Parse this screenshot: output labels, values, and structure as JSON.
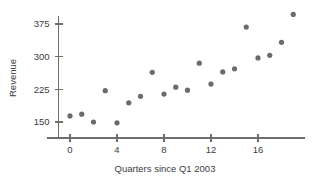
{
  "chart_data": {
    "type": "scatter",
    "title": "",
    "xlabel": "Quarters since Q1 2003",
    "ylabel": "Revenue",
    "xlim": [
      -1.2,
      20.5
    ],
    "ylim": [
      120,
      410
    ],
    "grid": false,
    "legend": null,
    "xticks": [
      0,
      4,
      8,
      12,
      16
    ],
    "yticks": [
      150,
      225,
      300,
      375
    ],
    "xtick_labels": [
      "0",
      "4",
      "8",
      "12",
      "16"
    ],
    "ytick_labels": [
      "150",
      "225",
      "300",
      "375"
    ],
    "point_color": "#6b6b6b",
    "axis_color": "#6e6e6e",
    "x": [
      0,
      1,
      2,
      3,
      4,
      5,
      6,
      7,
      8,
      9,
      10,
      11,
      12,
      13,
      14,
      15,
      16,
      17,
      18,
      19
    ],
    "values": [
      164,
      168,
      150,
      222,
      148,
      194,
      209,
      264,
      214,
      230,
      223,
      285,
      237,
      265,
      272,
      368,
      297,
      303,
      333,
      397
    ],
    "points": [
      {
        "x": 0,
        "y": 164
      },
      {
        "x": 1,
        "y": 168
      },
      {
        "x": 2,
        "y": 150
      },
      {
        "x": 3,
        "y": 222
      },
      {
        "x": 4,
        "y": 148
      },
      {
        "x": 5,
        "y": 194
      },
      {
        "x": 6,
        "y": 209
      },
      {
        "x": 7,
        "y": 264
      },
      {
        "x": 8,
        "y": 214
      },
      {
        "x": 9,
        "y": 230
      },
      {
        "x": 10,
        "y": 223
      },
      {
        "x": 11,
        "y": 285
      },
      {
        "x": 12,
        "y": 237
      },
      {
        "x": 13,
        "y": 265
      },
      {
        "x": 14,
        "y": 272
      },
      {
        "x": 15,
        "y": 368
      },
      {
        "x": 16,
        "y": 297
      },
      {
        "x": 17,
        "y": 303
      },
      {
        "x": 18,
        "y": 333
      },
      {
        "x": 19,
        "y": 397
      }
    ]
  }
}
